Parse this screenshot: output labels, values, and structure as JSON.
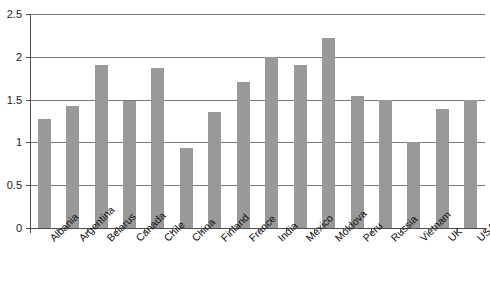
{
  "chart_data": {
    "type": "bar",
    "title": "",
    "subtitle": "",
    "xlabel": "",
    "ylabel": "",
    "ylim": [
      0,
      2.5
    ],
    "ytick_labels": [
      "0",
      "0.5",
      "1",
      "1.5",
      "2",
      "2.5"
    ],
    "ytick_values": [
      0,
      0.5,
      1,
      1.5,
      2,
      2.5
    ],
    "grid": true,
    "grid_axis": "y",
    "legend": false,
    "legend_position": "none",
    "bar_color": "#999999",
    "categories": [
      "Albania",
      "Argentina",
      "Belarus",
      "Canada",
      "Chile",
      "China",
      "Finland",
      "France",
      "India",
      "Mexico",
      "Moldova",
      "Peru",
      "Russia",
      "Vietnam",
      "UK",
      "USA"
    ],
    "values": [
      1.27,
      1.42,
      1.9,
      1.48,
      1.87,
      0.93,
      1.36,
      1.7,
      2.0,
      1.9,
      2.22,
      1.54,
      1.5,
      1.0,
      1.39,
      1.5
    ]
  }
}
